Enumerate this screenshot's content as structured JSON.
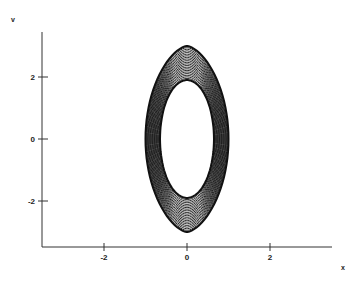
{
  "chart_data": {
    "type": "line",
    "subtype": "phase-portrait",
    "title": "",
    "xlabel": "x",
    "ylabel": "v",
    "xlim": [
      -3.5,
      3.5
    ],
    "ylim": [
      -3.5,
      3.5
    ],
    "x_ticks": [
      -2,
      0,
      2
    ],
    "y_ticks": [
      -2,
      0,
      2
    ],
    "x_tick_labels": [
      "-2",
      "0",
      "2"
    ],
    "y_tick_labels": [
      "-2",
      "0",
      "2"
    ],
    "grid": false,
    "legend": null,
    "series": [
      {
        "name": "trajectory",
        "shape": "ellipse-band",
        "center": [
          0,
          0
        ],
        "outer_semi_axes": {
          "x": 1.0,
          "v": 3.0
        },
        "inner_semi_axes": {
          "x": 0.65,
          "v": 1.9
        },
        "color": "#111111"
      }
    ]
  },
  "axes": {
    "x_label": "x",
    "y_label": "v",
    "x_ticks": [
      {
        "value": -2,
        "label": "-2"
      },
      {
        "value": 0,
        "label": "0"
      },
      {
        "value": 2,
        "label": "2"
      }
    ],
    "y_ticks": [
      {
        "value": 2,
        "label": "2"
      },
      {
        "value": 0,
        "label": "0"
      },
      {
        "value": -2,
        "label": "-2"
      }
    ]
  },
  "colors": {
    "line": "#111111",
    "axis": "#333333",
    "background": "#ffffff"
  }
}
